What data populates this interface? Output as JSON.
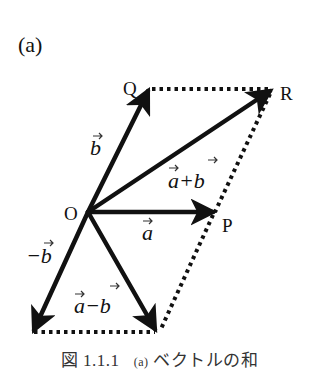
{
  "panel_label": "(a)",
  "points": {
    "O": {
      "label": "O",
      "x": 88,
      "y": 212
    },
    "P": {
      "label": "P",
      "x": 215,
      "y": 212
    },
    "Q": {
      "label": "Q",
      "x": 150,
      "y": 88
    },
    "R": {
      "label": "R",
      "x": 273,
      "y": 90
    },
    "neg_b_tip": {
      "x": 32,
      "y": 333
    },
    "a_minus_b_tip": {
      "x": 157,
      "y": 333
    }
  },
  "vector_labels": {
    "a": "a",
    "b": "b",
    "a_plus_b": "a+b",
    "neg_b": "−b",
    "a_minus_b": "a−b"
  },
  "caption": {
    "figure_number": "図 1.1.1",
    "sub_label": "(a)",
    "title": "ベクトルの和"
  },
  "colors": {
    "ink": "#111111",
    "caption": "#333333",
    "background": "#ffffff"
  }
}
